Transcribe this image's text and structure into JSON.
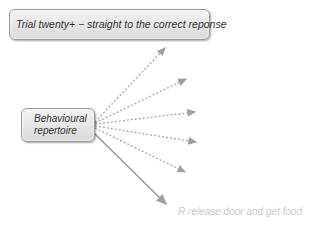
{
  "diagram": {
    "top_box": {
      "label": "Trial twenty+ − straight to the correct reponse"
    },
    "source_box": {
      "label_line1": "Behavioural",
      "label_line2": "repertoire"
    },
    "outcome_label": "R release door and get food",
    "colors": {
      "arrow": "#a0a0a0",
      "box_border": "#9a9a9a",
      "outcome_text": "#c8c8c8"
    },
    "arrows": {
      "dashed_targets": [
        [
          167,
          47
        ],
        [
          188,
          78
        ],
        [
          197,
          112
        ],
        [
          198,
          142
        ],
        [
          187,
          173
        ]
      ],
      "solid_target": [
        168,
        206
      ],
      "origin": [
        95,
        125
      ]
    }
  }
}
